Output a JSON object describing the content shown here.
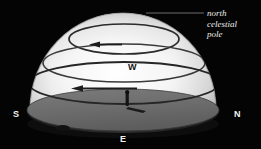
{
  "diagram": {
    "background_color": "#040404",
    "dome_color_light": "#fbfbfb",
    "dome_color_shadow": "#8e8e8e",
    "ground_color": "#6e6e6e",
    "trail_color": "#2a2a2a",
    "label_color": "#f2f2f2"
  },
  "annotation": {
    "line1": "north",
    "line2": "celestial",
    "line3": "pole",
    "leader_label": "leader-line"
  },
  "compass": {
    "south": "S",
    "north": "N",
    "east": "E",
    "west": "W"
  },
  "observer": {
    "label": "observer",
    "shadow_label": "observer-shadow"
  },
  "star_trails": [
    {
      "name": "upper-star-trail",
      "direction": "westward"
    },
    {
      "name": "middle-star-trail",
      "direction": "westward"
    },
    {
      "name": "lower-star-trail",
      "direction": "westward"
    }
  ]
}
